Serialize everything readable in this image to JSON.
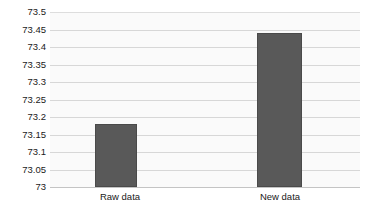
{
  "chart_data": {
    "type": "bar",
    "title": "",
    "subtitle": "",
    "xlabel": "",
    "ylabel": "",
    "categories": [
      "Raw data",
      "New data"
    ],
    "values": [
      73.18,
      73.44
    ],
    "series": [
      {
        "name": "",
        "values": [
          73.18,
          73.44
        ]
      }
    ],
    "ylim": [
      73,
      73.5
    ],
    "ytick_labels": [
      "73.5",
      "73.45",
      "73.4",
      "73.35",
      "73.3",
      "73.25",
      "73.2",
      "73.15",
      "73.1",
      "73.05",
      "73"
    ],
    "ytick_values": [
      73.5,
      73.45,
      73.4,
      73.35,
      73.3,
      73.25,
      73.2,
      73.15,
      73.1,
      73.05,
      73
    ],
    "ytick_step": 0.05,
    "grid": true,
    "grid_axis": "y",
    "legend": false,
    "legend_position": "none",
    "bar_color": "#595959",
    "bar_border_color": "#4a4a4a",
    "plot_background": "#fafafa",
    "grid_color": "#d7d7d7",
    "axis_text_color": "#1a1a1a",
    "page_background": "#ffffff"
  }
}
